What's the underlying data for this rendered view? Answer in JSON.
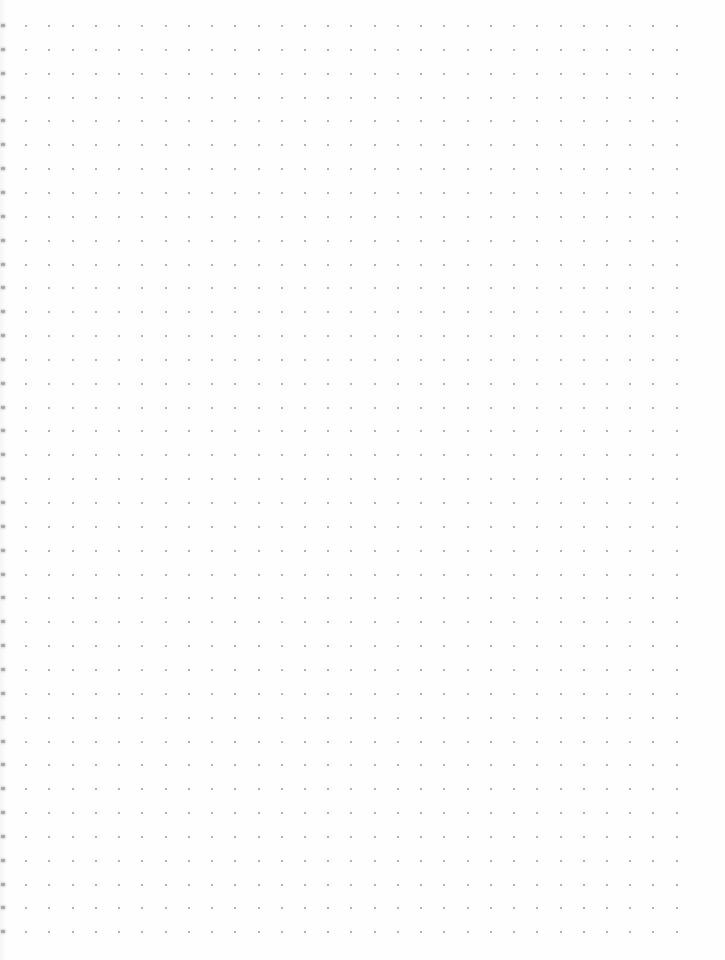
{
  "page": {
    "type": "dot-grid-notebook-page",
    "background_color": "#fefefe",
    "dot_color": "#9a9a9a",
    "edge_mark_color": "#a8a8a8"
  },
  "dot_grid": {
    "columns": 30,
    "rows": 39,
    "origin_x": 3,
    "origin_y": 26,
    "spacing_x": 23.23,
    "spacing_y": 23.85,
    "dot_size": 2,
    "left_edge_marks": true
  }
}
